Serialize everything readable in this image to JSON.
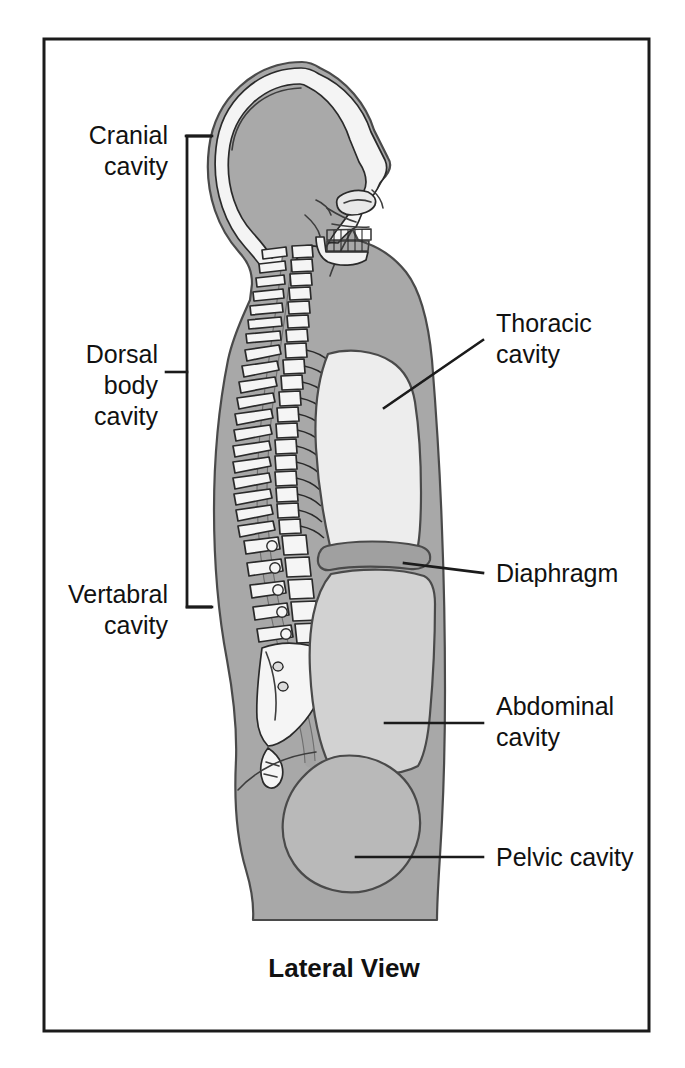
{
  "figure": {
    "caption": "Lateral View",
    "frame_color": "#1b1b1b",
    "background_color": "#ffffff"
  },
  "palette": {
    "body_fill": "#a8a8a8",
    "cavity_light": "#ededed",
    "bone_fill": "#f4f4f4",
    "cranial_fill": "#a9a9a9",
    "abdominal_fill": "#d2d2d2",
    "pelvic_fill": "#b9b9b9",
    "diaphragm_fill": "#a0a0a0",
    "outline_dark": "#3d3d3d",
    "text_color": "#111111"
  },
  "labels": {
    "left": [
      {
        "id": "cranial-cavity",
        "lines": [
          "Cranial",
          "cavity"
        ],
        "align": "end"
      },
      {
        "id": "dorsal-body-cavity",
        "lines": [
          "Dorsal",
          "body",
          "cavity"
        ],
        "align": "end"
      },
      {
        "id": "vertebral-cavity",
        "lines": [
          "Vertabral",
          "cavity"
        ],
        "align": "end"
      }
    ],
    "right": [
      {
        "id": "thoracic-cavity",
        "lines": [
          "Thoracic",
          "cavity"
        ],
        "align": "start"
      },
      {
        "id": "diaphragm",
        "lines": [
          "Diaphragm"
        ],
        "align": "start"
      },
      {
        "id": "abdominal-cavity",
        "lines": [
          "Abdominal",
          "cavity"
        ],
        "align": "start"
      },
      {
        "id": "pelvic-cavity",
        "lines": [
          "Pelvic cavity"
        ],
        "align": "start"
      }
    ]
  },
  "label_text": {
    "cranial_line1": "Cranial",
    "cranial_line2": "cavity",
    "dorsal_line1": "Dorsal",
    "dorsal_line2": "body",
    "dorsal_line3": "cavity",
    "vertebral_line1": "Vertabral",
    "vertebral_line2": "cavity",
    "thoracic_line1": "Thoracic",
    "thoracic_line2": "cavity",
    "diaphragm_line1": "Diaphragm",
    "abdominal_line1": "Abdominal",
    "abdominal_line2": "cavity",
    "pelvic_line1": "Pelvic cavity"
  },
  "diagram": {
    "view": "Lateral View",
    "regions": [
      "cranial cavity",
      "vertebral cavity",
      "thoracic cavity",
      "diaphragm",
      "abdominal cavity",
      "pelvic cavity"
    ],
    "bracket_groups": [
      {
        "name": "dorsal body cavity",
        "contains": [
          "cranial cavity",
          "vertebral cavity"
        ]
      }
    ]
  }
}
